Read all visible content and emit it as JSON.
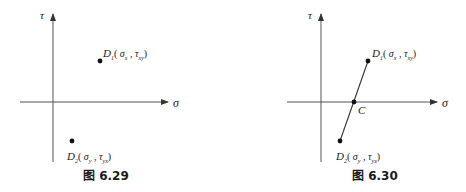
{
  "figures": [
    {
      "id": "fig-6-29",
      "caption": "图 6.29",
      "axes": {
        "x_label": "σ",
        "y_label": "τ"
      },
      "points": [
        {
          "name": "D1",
          "letter": "D",
          "sub": "1",
          "open": "(",
          "sigma": "σ",
          "sigma_sub": "x",
          "sep": ",",
          "tau": "τ",
          "tau_sub": "xy",
          "close": ")"
        },
        {
          "name": "D2",
          "letter": "D",
          "sub": "2",
          "open": "(",
          "sigma": "σ",
          "sigma_sub": "y",
          "sep": ",",
          "tau": "τ",
          "tau_sub": "yx",
          "close": ")"
        }
      ]
    },
    {
      "id": "fig-6-30",
      "caption": "图 6.30",
      "axes": {
        "x_label": "σ",
        "y_label": "τ"
      },
      "center_label": "C",
      "points": [
        {
          "name": "D1",
          "letter": "D",
          "sub": "1",
          "open": "(",
          "sigma": "σ",
          "sigma_sub": "x",
          "sep": ",",
          "tau": "τ",
          "tau_sub": "xy",
          "close": ")"
        },
        {
          "name": "D2",
          "letter": "D",
          "sub": "2",
          "open": "(",
          "sigma": "σ",
          "sigma_sub": "y",
          "sep": ",",
          "tau": "τ",
          "tau_sub": "yx",
          "close": ")"
        }
      ]
    }
  ],
  "colors": {
    "ink": "#1a1a1a",
    "axis": "#555555",
    "background": "#ffffff"
  }
}
